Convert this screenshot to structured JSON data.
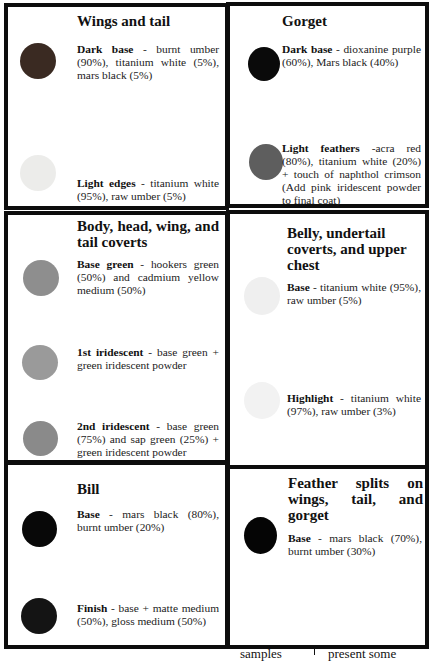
{
  "panels": [
    {
      "title": "Wings and tail",
      "entries": [
        {
          "name": "Dark base",
          "sep": " - ",
          "desc": "burnt umber (90%), titanium white (5%), mars black (5%)",
          "swatch_color": "#3a2a22"
        },
        {
          "name": "Light edges",
          "sep": " - ",
          "desc": "titanium white (95%), raw umber (5%)",
          "swatch_color": "#ececea"
        }
      ]
    },
    {
      "title": "Gorget",
      "entries": [
        {
          "name": "Dark base",
          "sep": " - ",
          "desc": "dioxanine purple (60%), Mars black (40%)",
          "swatch_color": "#0a0a0a"
        },
        {
          "name": "Light feathers",
          "sep": " -",
          "desc": "acra red (80%), titanium white (20%) + touch of naphthol crimson (Add pink iridescent powder to final coat)",
          "swatch_color": "#5e5e5e"
        }
      ]
    },
    {
      "title": "Body, head, wing, and tail coverts",
      "entries": [
        {
          "name": "Base green",
          "sep": " - ",
          "desc": "hookers green (50%) and cadmium yellow medium (50%)",
          "swatch_color": "#8e8e8e"
        },
        {
          "name": "1st iridescent",
          "sep": " - ",
          "desc": "base green + green iridescent powder",
          "swatch_color": "#9a9a9a"
        },
        {
          "name": "2nd iridescent",
          "sep": " - ",
          "desc": "base green (75%) and sap green (25%) + green iridescent powder",
          "swatch_color": "#8a8a8a"
        }
      ]
    },
    {
      "title": "Belly, undertail coverts, and upper chest",
      "entries": [
        {
          "name": "Base",
          "sep": " - ",
          "desc": "titanium white (95%), raw umber (5%)",
          "swatch_color": "#efefef"
        },
        {
          "name": "Highlight",
          "sep": " - ",
          "desc": "titanium white (97%), raw umber (3%)",
          "swatch_color": "#f2f2f2"
        }
      ]
    },
    {
      "title": "Bill",
      "entries": [
        {
          "name": "Base",
          "sep": " - ",
          "desc": "mars black (80%), burnt umber (20%)",
          "swatch_color": "#080808"
        },
        {
          "name": "Finish",
          "sep": " - ",
          "desc": "base + matte medium (50%), gloss medium (50%)",
          "swatch_color": "#141414"
        }
      ]
    },
    {
      "title": "Feather splits on wings, tail, and gorget",
      "entries": [
        {
          "name": "Base",
          "sep": " - ",
          "desc": "mars black (70%), burnt umber (30%)",
          "swatch_color": "#050505"
        }
      ]
    }
  ],
  "footer": {
    "left_fragment": "samples",
    "right_fragment": "present some"
  }
}
